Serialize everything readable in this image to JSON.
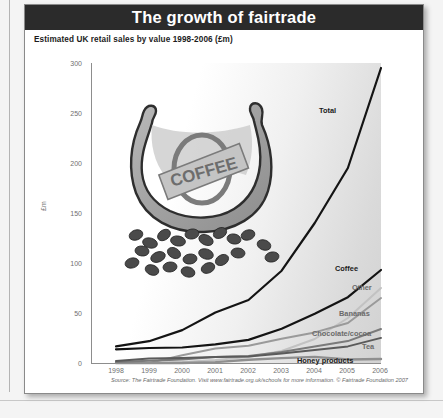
{
  "title": "The growth of fairtrade",
  "subtitle": "Estimated UK retail sales by value 1998-2006 (£m)",
  "source": "Source: The Fairtrade Foundation. Visit www.fairtrade.org.uk/schools for more information. © Fairtrade Foundation 2007",
  "illustration": {
    "label": "COFFEE",
    "name": "coffee-sack-illustration"
  },
  "colors": {
    "title_bar": "#2b2b2b",
    "total": "#141414",
    "coffee": "#141414",
    "other": "#c2c2c2",
    "bananas": "#9a9a9a",
    "chocolate": "#7a7a7a",
    "tea": "#5a5a5a",
    "honey": "#8f8f8f",
    "axis": "#8d8d8d"
  },
  "chart_data": {
    "type": "line",
    "title": "The growth of fairtrade",
    "subtitle": "Estimated UK retail sales by value 1998-2006 (£m)",
    "xlabel": "",
    "ylabel": "£m",
    "ylim": [
      0,
      300
    ],
    "yticks": [
      0,
      50,
      100,
      150,
      200,
      250,
      300
    ],
    "x": [
      "1998",
      "1999",
      "2000",
      "2001",
      "2002",
      "2003",
      "2004",
      "2005",
      "2006"
    ],
    "categories": [
      "1998",
      "1999",
      "2000",
      "2001",
      "2002",
      "2003",
      "2004",
      "2005",
      "2006"
    ],
    "grid": false,
    "legend": "inline-right-labels",
    "series": [
      {
        "name": "Total",
        "values": [
          16.7,
          21.8,
          32.9,
          50.5,
          63.0,
          92.3,
          140.0,
          195.0,
          295.0
        ]
      },
      {
        "name": "Coffee",
        "values": [
          13.7,
          15.0,
          15.5,
          18.6,
          23.1,
          34.3,
          49.3,
          65.8,
          93.0
        ]
      },
      {
        "name": "Other",
        "values": [
          0.0,
          0.0,
          1.0,
          3.0,
          6.0,
          12.0,
          24.0,
          45.0,
          75.0
        ]
      },
      {
        "name": "Bananas",
        "values": [
          0.0,
          0.0,
          7.8,
          14.6,
          17.3,
          24.3,
          30.6,
          40.0,
          65.0
        ]
      },
      {
        "name": "Chocolate/cocoa",
        "values": [
          1.0,
          2.3,
          3.6,
          6.0,
          7.0,
          10.9,
          16.5,
          21.9,
          34.0
        ]
      },
      {
        "name": "Tea",
        "values": [
          2.0,
          4.5,
          5.1,
          5.9,
          6.5,
          9.5,
          12.9,
          16.6,
          25.1
        ]
      },
      {
        "name": "Honey products",
        "values": [
          0.0,
          0.0,
          0.0,
          0.9,
          3.2,
          4.9,
          6.1,
          3.5,
          4.0
        ]
      }
    ]
  },
  "axis": {
    "y_ticks": [
      "300",
      "250",
      "200",
      "150",
      "100",
      "50",
      "0"
    ],
    "y_title": "£m",
    "x_ticks": [
      "1998",
      "1999",
      "2000",
      "2001",
      "2002",
      "2003",
      "2004",
      "2005",
      "2006"
    ]
  },
  "series_labels": {
    "total": "Total",
    "coffee": "Coffee",
    "other": "Other",
    "bananas": "Bananas",
    "chocolate": "Chocolate/cocoa",
    "tea": "Tea",
    "honey": "Honey products"
  }
}
